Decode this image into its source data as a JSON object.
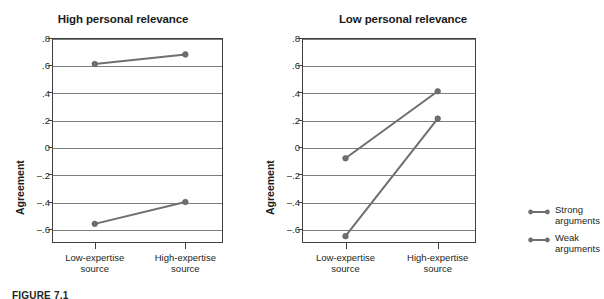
{
  "figure": {
    "caption": "FIGURE 7.1"
  },
  "legend": {
    "position": "right",
    "entries": [
      {
        "name": "Strong arguments",
        "line1": "Strong",
        "line2": "arguments",
        "color": "#6f6f6f"
      },
      {
        "name": "Weak arguments",
        "line1": "Weak",
        "line2": "arguments",
        "color": "#6f6f6f"
      }
    ]
  },
  "axis": {
    "ylabel": "Agreement",
    "yticks": [
      ".8",
      ".6",
      ".4",
      ".2",
      "0",
      "–.2",
      "–.4",
      "–.6"
    ],
    "ytick_values": [
      0.8,
      0.6,
      0.4,
      0.2,
      0,
      -0.2,
      -0.4,
      -0.6
    ],
    "xcat1_line1": "Low-expertise",
    "xcat1_line2": "source",
    "xcat2_line1": "High-expertise",
    "xcat2_line2": "source"
  },
  "chart_data": [
    {
      "type": "line",
      "title": "High personal relevance",
      "xlabel": "",
      "ylabel": "Agreement",
      "categories": [
        "Low-expertise source",
        "High-expertise source"
      ],
      "ylim": [
        -0.7,
        0.8
      ],
      "yticks": [
        0.8,
        0.6,
        0.4,
        0.2,
        0,
        -0.2,
        -0.4,
        -0.6
      ],
      "grid": true,
      "legend_position": "right",
      "series": [
        {
          "name": "Strong arguments",
          "values": [
            0.61,
            0.68
          ],
          "color": "#6f6f6f"
        },
        {
          "name": "Weak arguments",
          "values": [
            -0.56,
            -0.4
          ],
          "color": "#6f6f6f"
        }
      ]
    },
    {
      "type": "line",
      "title": "Low personal relevance",
      "xlabel": "",
      "ylabel": "Agreement",
      "categories": [
        "Low-expertise source",
        "High-expertise source"
      ],
      "ylim": [
        -0.7,
        0.8
      ],
      "yticks": [
        0.8,
        0.6,
        0.4,
        0.2,
        0,
        -0.2,
        -0.4,
        -0.6
      ],
      "grid": true,
      "legend_position": "right",
      "series": [
        {
          "name": "Strong arguments",
          "values": [
            -0.08,
            0.41
          ],
          "color": "#6f6f6f"
        },
        {
          "name": "Weak arguments",
          "values": [
            -0.65,
            0.21
          ],
          "color": "#6f6f6f"
        }
      ]
    }
  ]
}
